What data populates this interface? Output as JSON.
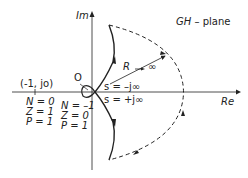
{
  "diagram": {
    "type": "nyquist-plot",
    "plane_label": "GH – plane",
    "axes": {
      "imaginary": "Im",
      "real": "Re"
    },
    "critical_point": "(-1, jo)",
    "origin_label": "O",
    "radius_label": "R → ∞",
    "path_labels": {
      "s_neg": "s = –j∞",
      "s_pos": "s = +j∞"
    },
    "left_region": {
      "N": "N = 0",
      "Z": "Z = 1",
      "P": "P = 1"
    },
    "right_region": {
      "N": "N = –1",
      "Z": "Z = 0",
      "P": "P = 1"
    },
    "colors": {
      "line": "#222222",
      "background": "#ffffff"
    }
  }
}
